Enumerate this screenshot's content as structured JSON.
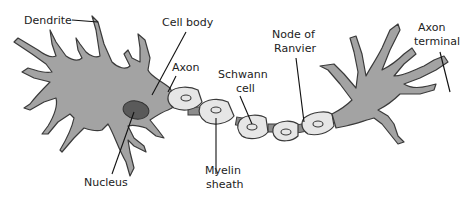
{
  "diagram": {
    "colors": {
      "cell_fill": "#a3a3a3",
      "outline": "#3a3a3a",
      "myelin_fill": "#e6e6e6",
      "nucleus_fill": "#5a5a5a",
      "node_fill": "#8c8c8c",
      "background": "#ffffff"
    },
    "labels": {
      "dendrite": "Dendrite",
      "cell_body": "Cell body",
      "axon": "Axon",
      "schwann_line1": "Schwann",
      "schwann_line2": "cell",
      "node_line1": "Node of",
      "node_line2": "Ranvier",
      "terminal_line1": "Axon",
      "terminal_line2": "terminal",
      "nucleus": "Nucleus",
      "myelin_line1": "Myelin",
      "myelin_line2": "sheath"
    }
  }
}
